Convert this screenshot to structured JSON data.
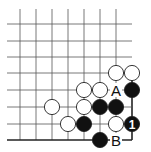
{
  "diagram": {
    "type": "go-board-corner",
    "corner": "bottom-right",
    "grid": {
      "cols_x": [
        20,
        36,
        52,
        68,
        84,
        100,
        116,
        132
      ],
      "rows_y": [
        24,
        41,
        57,
        73,
        90,
        107,
        124,
        140
      ],
      "line_color": "#555555",
      "edge_color": "#222222"
    },
    "stones": [
      {
        "color": "white",
        "x": 116,
        "y": 73
      },
      {
        "color": "white",
        "x": 132,
        "y": 73
      },
      {
        "color": "white",
        "x": 84,
        "y": 90
      },
      {
        "color": "white",
        "x": 100,
        "y": 90
      },
      {
        "color": "black",
        "x": 132,
        "y": 90
      },
      {
        "color": "white",
        "x": 52,
        "y": 107
      },
      {
        "color": "white",
        "x": 84,
        "y": 107
      },
      {
        "color": "black",
        "x": 100,
        "y": 107
      },
      {
        "color": "black",
        "x": 116,
        "y": 107
      },
      {
        "color": "white",
        "x": 68,
        "y": 124
      },
      {
        "color": "black",
        "x": 84,
        "y": 124
      },
      {
        "color": "white",
        "x": 116,
        "y": 124
      },
      {
        "color": "black",
        "x": 132,
        "y": 124,
        "label": "1"
      },
      {
        "color": "black",
        "x": 100,
        "y": 140
      }
    ],
    "labels": [
      {
        "text": "A",
        "x": 116,
        "y": 90
      },
      {
        "text": "B",
        "x": 116,
        "y": 140
      }
    ],
    "move_number": "1"
  }
}
